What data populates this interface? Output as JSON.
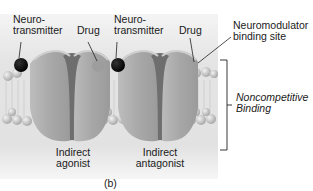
{
  "figure": {
    "panel_label": "(b)",
    "labels": {
      "neurotransmitter_left": [
        "Neuro-",
        "transmitter"
      ],
      "drug_left": "Drug",
      "neurotransmitter_right": [
        "Neuro-",
        "transmitter"
      ],
      "drug_right": "Drug",
      "neuromodulator_site": [
        "Neuromodulator",
        "binding site"
      ],
      "bracket_label": [
        "Noncompetitive",
        "Binding"
      ],
      "receptor_left": [
        "Indirect",
        "agonist"
      ],
      "receptor_right": [
        "Indirect",
        "antagonist"
      ]
    },
    "colors": {
      "background_panel": "#dcdcdc",
      "membrane_head": "#c8c8c8",
      "receptor": "#a9a9a9",
      "receptor_dark": "#6e6e6e",
      "neurotransmitter": "#0a0a0a",
      "drug": "#9a9a9a",
      "text": "#1a1a1a"
    }
  }
}
